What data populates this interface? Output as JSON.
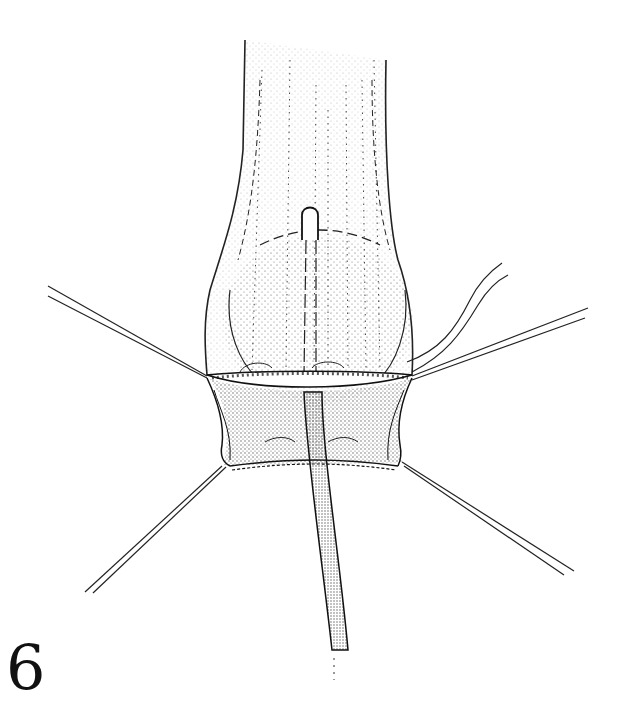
{
  "figure": {
    "number": "6",
    "colors": {
      "ink": "#111111",
      "background": "#ffffff",
      "stipple": "#333333"
    },
    "elements": [
      "tubular-structure",
      "balloon",
      "central-catheter-tip",
      "incision-margin",
      "retracted-wound-flaps",
      "stay-suture-upper-left",
      "stay-suture-upper-right",
      "stay-suture-lower-left",
      "stay-suture-lower-right",
      "thread-pair-right",
      "drainage-tube"
    ]
  }
}
